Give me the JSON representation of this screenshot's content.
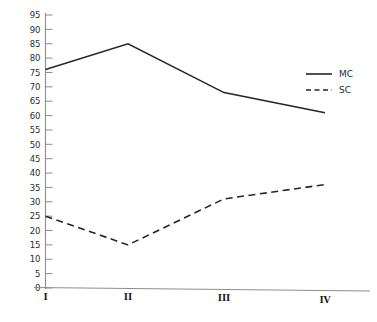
{
  "chart_data": {
    "type": "line",
    "title": "",
    "xlabel": "",
    "ylabel": "",
    "categories": [
      "I",
      "II",
      "III",
      "IV"
    ],
    "series": [
      {
        "name": "MC",
        "values": [
          76,
          85,
          68,
          61
        ],
        "style": "solid"
      },
      {
        "name": "SC",
        "values": [
          25,
          15,
          31,
          36
        ],
        "style": "dashed"
      }
    ],
    "ylim": [
      0,
      95
    ],
    "ytick_step": 5,
    "yticks": [
      0,
      5,
      10,
      15,
      20,
      25,
      30,
      35,
      40,
      45,
      50,
      55,
      60,
      65,
      70,
      75,
      80,
      85,
      90,
      95
    ],
    "ytick_labels": [
      "0",
      "5",
      "10",
      "15",
      "20",
      "25",
      "30",
      "35",
      "40",
      "45",
      "50",
      "55",
      "60",
      "65",
      "70",
      "75",
      "80",
      "85",
      "90",
      "95"
    ],
    "grid": false,
    "legend_position": "top-right",
    "legend_entries": [
      "MC",
      "SC"
    ],
    "colors": {
      "axis": "#8d8d8d",
      "series_mc": "#262626",
      "series_sc": "#262626",
      "background": "#ffffff",
      "text": "#2b2b2b"
    }
  }
}
